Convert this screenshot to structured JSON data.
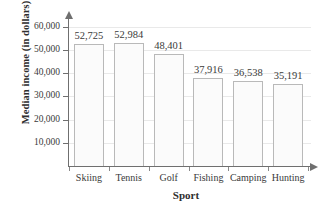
{
  "chart_data": {
    "type": "bar",
    "title": "",
    "xlabel": "Sport",
    "ylabel": "Median income (in dollars)",
    "categories": [
      "Skiing",
      "Tennis",
      "Golf",
      "Fishing",
      "Camping",
      "Hunting"
    ],
    "values": [
      52725,
      52984,
      48401,
      37916,
      36538,
      35191
    ],
    "value_labels": [
      "52,725",
      "52,984",
      "48,401",
      "37,916",
      "36,538",
      "35,191"
    ],
    "ytick_labels": [
      "60,000",
      "50,000",
      "40,000",
      "30,000",
      "20,000",
      "10,000"
    ],
    "ytick_values": [
      60000,
      50000,
      40000,
      30000,
      20000,
      10000
    ],
    "ylim": [
      0,
      62000
    ],
    "grid": true,
    "legend": "none",
    "bar_fill_color": "#fbfbfb",
    "bar_border_color": "#b9b9b9",
    "axis_color": "#6f6f6f",
    "grid_color": "#e9e9e9",
    "text_color": "#3a3a3a"
  }
}
